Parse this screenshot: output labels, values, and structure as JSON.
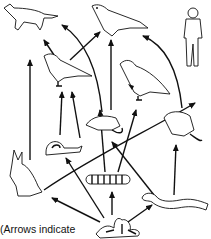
{
  "diagram": {
    "type": "food-web",
    "caption": "(Arrows indicate",
    "organisms": [
      {
        "id": "fox",
        "label": "fox",
        "x": 30,
        "y": 18
      },
      {
        "id": "hawk",
        "label": "hawk",
        "x": 122,
        "y": 22
      },
      {
        "id": "human",
        "label": "human",
        "x": 193,
        "y": 35
      },
      {
        "id": "bird",
        "label": "bird",
        "x": 65,
        "y": 68
      },
      {
        "id": "grouse",
        "label": "grouse",
        "x": 143,
        "y": 78
      },
      {
        "id": "snail",
        "label": "snail",
        "x": 58,
        "y": 145
      },
      {
        "id": "shrew",
        "label": "shrew",
        "x": 108,
        "y": 122
      },
      {
        "id": "mouse",
        "label": "mouse",
        "x": 178,
        "y": 123
      },
      {
        "id": "rabbit",
        "label": "rabbit",
        "x": 25,
        "y": 180
      },
      {
        "id": "caterpillar",
        "label": "caterpillar",
        "x": 107,
        "y": 180
      },
      {
        "id": "earthworm",
        "label": "earthworm",
        "x": 172,
        "y": 197
      },
      {
        "id": "plant",
        "label": "plant",
        "x": 117,
        "y": 225
      }
    ],
    "arrows": [
      {
        "from": "plant",
        "to": "rabbit"
      },
      {
        "from": "plant",
        "to": "snail"
      },
      {
        "from": "plant",
        "to": "caterpillar"
      },
      {
        "from": "plant",
        "to": "earthworm"
      },
      {
        "from": "plant",
        "to": "shrew"
      },
      {
        "from": "rabbit",
        "to": "fox"
      },
      {
        "from": "rabbit",
        "to": "human"
      },
      {
        "from": "snail",
        "to": "bird"
      },
      {
        "from": "caterpillar",
        "to": "bird"
      },
      {
        "from": "caterpillar",
        "to": "grouse"
      },
      {
        "from": "earthworm",
        "to": "shrew"
      },
      {
        "from": "earthworm",
        "to": "mouse"
      },
      {
        "from": "bird",
        "to": "fox"
      },
      {
        "from": "bird",
        "to": "hawk"
      },
      {
        "from": "shrew",
        "to": "hawk"
      },
      {
        "from": "shrew",
        "to": "fox"
      },
      {
        "from": "mouse",
        "to": "hawk"
      }
    ]
  }
}
